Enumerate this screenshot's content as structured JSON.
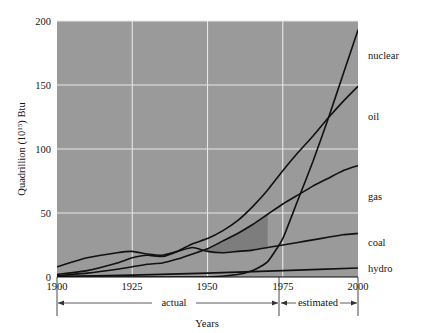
{
  "chart_data": {
    "type": "line",
    "title": "",
    "subtitle": "",
    "xlabel": "Years",
    "ylabel_main": "Quadrillion (10",
    "ylabel_exp": "15",
    "ylabel_tail": ") Btu",
    "ylabel_full": "Quadrillion (10^15) Btu",
    "xlim": [
      1900,
      2000
    ],
    "ylim": [
      0,
      200
    ],
    "grid": true,
    "legend_position": "right-of-plot-inline",
    "plot_background": "#9a9a9a",
    "gridline_color": "#e8e8e8",
    "curve_color": "#111111",
    "shaded_band_color": "#7d7d7d",
    "xticks": [
      1900,
      1925,
      1950,
      1975,
      2000
    ],
    "xtick_labels": [
      "1900",
      "1925",
      "1950",
      "1975",
      "2000"
    ],
    "yticks": [
      0,
      50,
      100,
      150,
      200
    ],
    "ytick_labels": [
      "0",
      "50",
      "100",
      "150",
      "200"
    ],
    "annotations": [
      {
        "name": "actual",
        "label": "actual",
        "from_year": 1900,
        "to_year": 1972
      },
      {
        "name": "estimated",
        "label": "estimated",
        "from_year": 1972,
        "to_year": 2000
      }
    ],
    "series": [
      {
        "name": "nuclear",
        "label": "nuclear",
        "x": [
          1900,
          1925,
          1950,
          1960,
          1965,
          1970,
          1975,
          1980,
          1985,
          1990,
          1995,
          2000
        ],
        "values": [
          0,
          0,
          0,
          2,
          5,
          12,
          30,
          60,
          90,
          123,
          158,
          193
        ]
      },
      {
        "name": "oil",
        "label": "oil",
        "x": [
          1900,
          1910,
          1920,
          1925,
          1930,
          1935,
          1940,
          1945,
          1950,
          1955,
          1960,
          1965,
          1970,
          1975,
          1980,
          1985,
          1990,
          1995,
          2000
        ],
        "values": [
          2,
          5,
          11,
          15,
          17,
          16,
          20,
          26,
          30,
          36,
          44,
          55,
          68,
          83,
          97,
          110,
          124,
          137,
          149
        ]
      },
      {
        "name": "gas",
        "label": "gas",
        "x": [
          1900,
          1910,
          1920,
          1925,
          1930,
          1935,
          1940,
          1945,
          1950,
          1955,
          1960,
          1965,
          1970,
          1975,
          1980,
          1985,
          1990,
          1995,
          2000
        ],
        "values": [
          1,
          3,
          6,
          8,
          10,
          11,
          14,
          18,
          22,
          28,
          34,
          41,
          49,
          57,
          64,
          71,
          77,
          83,
          87
        ]
      },
      {
        "name": "coal",
        "label": "coal",
        "x": [
          1900,
          1910,
          1920,
          1925,
          1930,
          1935,
          1940,
          1945,
          1950,
          1955,
          1960,
          1965,
          1970,
          1975,
          1980,
          1985,
          1990,
          1995,
          2000
        ],
        "values": [
          8,
          15,
          19,
          20,
          18,
          17,
          20,
          23,
          20,
          19,
          20,
          21,
          23,
          25,
          27,
          29,
          31,
          33,
          34
        ]
      },
      {
        "name": "hydro",
        "label": "hydro",
        "x": [
          1900,
          1925,
          1950,
          1975,
          2000
        ],
        "values": [
          0.5,
          1.5,
          3,
          5,
          7
        ]
      }
    ]
  },
  "labels": {
    "nuclear": "nuclear",
    "oil": "oil",
    "gas": "gas",
    "coal": "coal",
    "hydro": "hydro",
    "actual": "actual",
    "estimated": "estimated",
    "years": "Years",
    "y0": "0",
    "y50": "50",
    "y100": "100",
    "y150": "150",
    "y200": "200",
    "x1900": "1900",
    "x1925": "1925",
    "x1950": "1950",
    "x1975": "1975",
    "x2000": "2000",
    "ylabel_a": "Quadrillion (10",
    "ylabel_b": "15",
    "ylabel_c": ") Btu"
  }
}
